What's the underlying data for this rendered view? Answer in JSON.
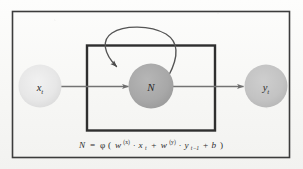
{
  "figure": {
    "outer_frame": {
      "name": "outer-border",
      "color": "#3a3a3a"
    },
    "inner_plate": {
      "name": "recurrent-unit-plate",
      "color": "#2f2f2f"
    },
    "background_color": "#fbfbfa"
  },
  "nodes": [
    {
      "id": "input",
      "label": "x",
      "subscript": "t",
      "fill": "#e8e8e8",
      "role": "input-node"
    },
    {
      "id": "neuron",
      "label": "N",
      "subscript": "",
      "fill": "#a9a9a9",
      "role": "neuron-node"
    },
    {
      "id": "output",
      "label": "y",
      "subscript": "t",
      "fill": "#c4c4c4",
      "role": "output-node"
    }
  ],
  "edges": [
    {
      "id": "input-to-neuron",
      "from": "input",
      "to": "neuron",
      "style": "straight-arrow",
      "color": "#707070"
    },
    {
      "id": "neuron-to-output",
      "from": "neuron",
      "to": "output",
      "style": "straight-arrow",
      "color": "#707070"
    },
    {
      "id": "self-loop",
      "from": "neuron",
      "to": "neuron",
      "style": "curved-feedback-arrow",
      "color": "#555555"
    }
  ],
  "formula": {
    "name": "neuron-activation-formula",
    "lhs": "N",
    "equals": "=",
    "activation": "φ",
    "open_paren": "(",
    "w_x_base": "w",
    "w_x_sup": "(x)",
    "dot1": "·",
    "x_base": "x",
    "x_sub": "t",
    "plus1": "+",
    "w_y_base": "w",
    "w_y_sup": "(y)",
    "dot2": "·",
    "y_base": "y",
    "y_sub": "t−1",
    "plus2": "+",
    "bias": "b",
    "close_paren": ")",
    "plain": "N = φ( w(x)·xt + w(y)·yt−1 + b )"
  }
}
